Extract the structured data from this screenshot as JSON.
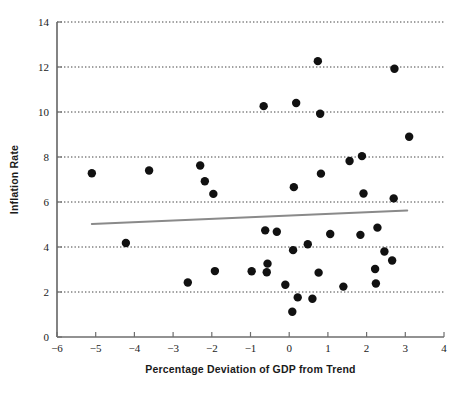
{
  "chart_data": {
    "type": "scatter",
    "title": "",
    "xlabel": "Percentage Deviation of GDP from Trend",
    "ylabel": "Inflation Rate",
    "xlim": [
      -6,
      4
    ],
    "ylim": [
      0,
      14
    ],
    "xticks": [
      -6,
      -5,
      -4,
      -3,
      -2,
      -1,
      0,
      1,
      2,
      3,
      4
    ],
    "xtick_labels": [
      "−6",
      "−5",
      "−4",
      "−3",
      "−2",
      "−1",
      "0",
      "1",
      "2",
      "3",
      "4"
    ],
    "yticks": [
      0,
      2,
      4,
      6,
      8,
      10,
      12,
      14
    ],
    "ytick_labels": [
      "0",
      "2",
      "4",
      "6",
      "8",
      "10",
      "12",
      "14"
    ],
    "gridlines_y": [
      2,
      4,
      6,
      8,
      10,
      12,
      14
    ],
    "grid": true,
    "grid_style": "dotted",
    "legend": null,
    "marker": {
      "shape": "circle",
      "color": "#111111",
      "size": 4.2
    },
    "points": [
      {
        "x": -5.1,
        "y": 7.28
      },
      {
        "x": -4.22,
        "y": 4.18
      },
      {
        "x": -3.62,
        "y": 7.4
      },
      {
        "x": -2.62,
        "y": 2.42
      },
      {
        "x": -2.3,
        "y": 7.62
      },
      {
        "x": -2.18,
        "y": 6.92
      },
      {
        "x": -1.96,
        "y": 6.36
      },
      {
        "x": -1.92,
        "y": 2.93
      },
      {
        "x": -0.97,
        "y": 2.92
      },
      {
        "x": -0.66,
        "y": 10.26
      },
      {
        "x": -0.62,
        "y": 4.74
      },
      {
        "x": -0.58,
        "y": 2.88
      },
      {
        "x": -0.56,
        "y": 3.26
      },
      {
        "x": -0.32,
        "y": 4.68
      },
      {
        "x": -0.1,
        "y": 2.32
      },
      {
        "x": 0.08,
        "y": 1.12
      },
      {
        "x": 0.1,
        "y": 3.86
      },
      {
        "x": 0.12,
        "y": 6.66
      },
      {
        "x": 0.18,
        "y": 10.4
      },
      {
        "x": 0.22,
        "y": 1.76
      },
      {
        "x": 0.48,
        "y": 4.12
      },
      {
        "x": 0.6,
        "y": 1.7
      },
      {
        "x": 0.74,
        "y": 12.26
      },
      {
        "x": 0.76,
        "y": 2.86
      },
      {
        "x": 0.8,
        "y": 9.92
      },
      {
        "x": 0.82,
        "y": 7.26
      },
      {
        "x": 1.06,
        "y": 4.58
      },
      {
        "x": 1.4,
        "y": 2.24
      },
      {
        "x": 1.56,
        "y": 7.82
      },
      {
        "x": 1.84,
        "y": 4.54
      },
      {
        "x": 1.88,
        "y": 8.04
      },
      {
        "x": 1.92,
        "y": 6.38
      },
      {
        "x": 2.22,
        "y": 3.02
      },
      {
        "x": 2.24,
        "y": 2.38
      },
      {
        "x": 2.28,
        "y": 4.86
      },
      {
        "x": 2.46,
        "y": 3.8
      },
      {
        "x": 2.66,
        "y": 3.4
      },
      {
        "x": 2.7,
        "y": 6.16
      },
      {
        "x": 2.72,
        "y": 11.92
      },
      {
        "x": 3.1,
        "y": 8.9
      }
    ],
    "trend_line": {
      "x_start": -5.1,
      "y_start": 5.02,
      "x_end": 3.05,
      "y_end": 5.62,
      "color": "#8a8a8a"
    }
  },
  "colors": {
    "background": "#ffffff",
    "marker": "#111111",
    "trend": "#8a8a8a",
    "axis": "#6e6e6e",
    "grid": "#2b2b2b",
    "text": "#1a1a1a"
  }
}
